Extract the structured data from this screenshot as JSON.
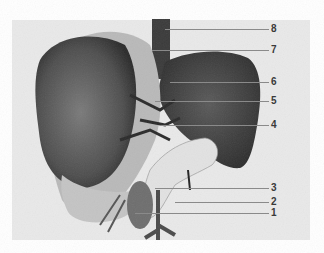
{
  "figure": {
    "background_color": "#e9e9e9",
    "labels": [
      {
        "id": "8",
        "text": "8",
        "y": 29,
        "x_start": 165
      },
      {
        "id": "7",
        "text": "7",
        "y": 50,
        "x_start": 152
      },
      {
        "id": "6",
        "text": "6",
        "y": 82,
        "x_start": 170
      },
      {
        "id": "5",
        "text": "5",
        "y": 101,
        "x_start": 155
      },
      {
        "id": "4",
        "text": "4",
        "y": 125,
        "x_start": 160
      },
      {
        "id": "3",
        "text": "3",
        "y": 188,
        "x_start": 155
      },
      {
        "id": "2",
        "text": "2",
        "y": 202,
        "x_start": 175
      },
      {
        "id": "1",
        "text": "1",
        "y": 213,
        "x_start": 135
      }
    ]
  }
}
